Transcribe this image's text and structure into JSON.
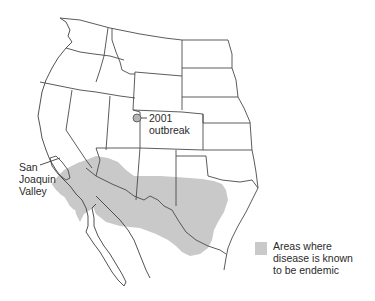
{
  "map": {
    "region": "Western United States and northern Mexico",
    "fill_color": "#c9c9c9",
    "border_color": "#4a4a4a",
    "marker_color": "#b5b5b5"
  },
  "annotations": {
    "outbreak": {
      "year": "2001",
      "label": "outbreak"
    },
    "valley": {
      "line1": "San",
      "line2": "Joaquin",
      "line3": "Valley"
    }
  },
  "legend": {
    "swatch_color": "#c9c9c9",
    "line1": "Areas where",
    "line2": "disease is known",
    "line3": "to be endemic"
  }
}
